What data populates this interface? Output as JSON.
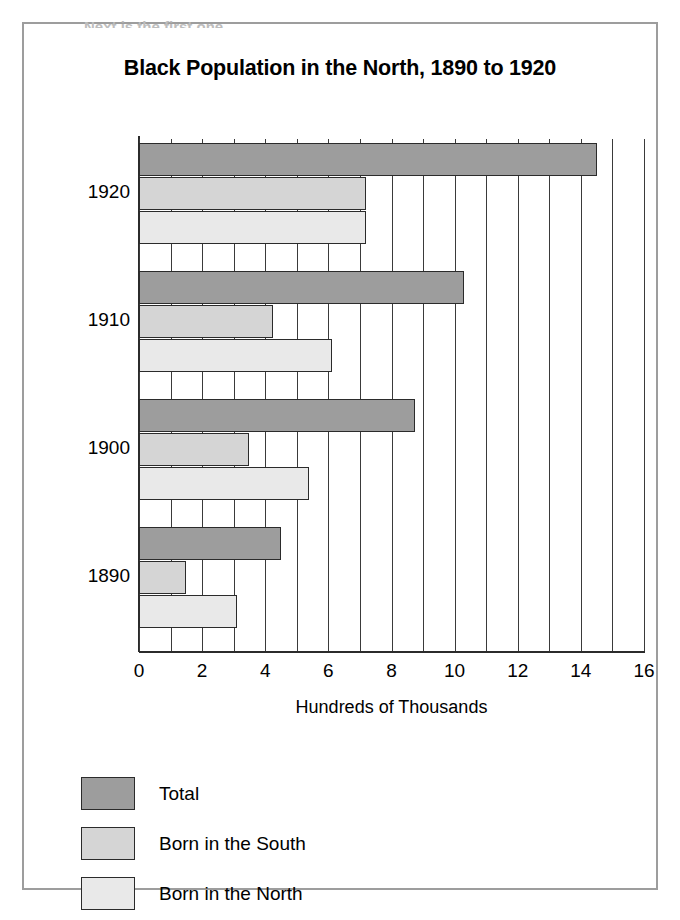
{
  "page": {
    "top_fragment": "Next is the first one,"
  },
  "chart_data": {
    "type": "bar",
    "orientation": "horizontal",
    "title": "Black Population in the North, 1890 to 1920",
    "xlabel": "Hundreds of Thousands",
    "ylabel": "",
    "categories": [
      "1920",
      "1910",
      "1900",
      "1890"
    ],
    "series": [
      {
        "name": "Total",
        "color": "#9d9d9d",
        "values": [
          14.5,
          10.3,
          8.75,
          4.5
        ]
      },
      {
        "name": "Born in the South",
        "color": "#d5d5d5",
        "values": [
          7.2,
          4.25,
          3.5,
          1.5
        ]
      },
      {
        "name": "Born in the North",
        "color": "#e9e9e9",
        "values": [
          7.2,
          6.1,
          5.4,
          3.1
        ]
      }
    ],
    "xlim": [
      0,
      16
    ],
    "xticks": [
      0,
      2,
      4,
      6,
      8,
      10,
      12,
      14,
      16
    ],
    "xtick_labels": [
      "0",
      "2",
      "4",
      "6",
      "8",
      "10",
      "12",
      "14",
      "16"
    ],
    "minor_gridline_step": 1,
    "grid": true,
    "legend_position": "below-axis-left"
  }
}
